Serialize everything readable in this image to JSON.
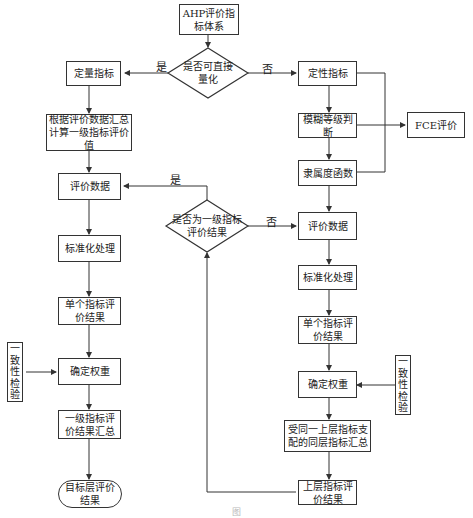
{
  "diagram": {
    "colors": {
      "stroke": "#333333",
      "background": "#ffffff",
      "text": "#222222"
    },
    "nodes": {
      "ahp_system": "AHP评价指标体系",
      "decision_quantifiable": "是否可直接量化",
      "quantitative": "定量指标",
      "calc_first_level": "根据评价数据汇总计算一级指标评价值",
      "left_eval_data": "评价数据",
      "left_standardize": "标准化处理",
      "left_single_result": "单个指标评价结果",
      "left_weight": "确定权重",
      "left_consistency": "一致性检验",
      "first_level_summary": "一级指标评价结果汇总",
      "target_result": "目标层评价结果",
      "qualitative": "定性指标",
      "fuzzy_grade": "模糊等级判断",
      "fce": "FCE评价",
      "membership": "隶属度函数",
      "decision_first_level": "是否为一级指标评价结果",
      "right_eval_data": "评价数据",
      "right_standardize": "标准化处理",
      "right_single_result": "单个指标评价结果",
      "right_weight": "确定权重",
      "right_consistency": "一致性检验",
      "same_level_summary": "受同一上层指标支配的同层指标汇总",
      "upper_result": "上层指标评价结果"
    },
    "edge_labels": {
      "quantifiable_yes": "是",
      "quantifiable_no": "否",
      "first_level_yes": "是",
      "first_level_no": "否"
    },
    "caption": "图"
  }
}
